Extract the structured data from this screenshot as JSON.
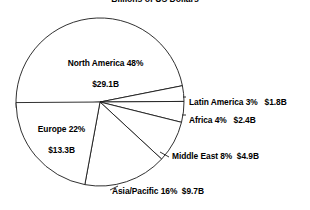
{
  "chart_data": {
    "type": "pie",
    "title": "Billions of US Dollars",
    "subtitle": "",
    "xlabel": "",
    "ylabel": "",
    "grid": false,
    "legend": "none",
    "label_style": "outside-and-inside callouts",
    "units": "Billions of US Dollars",
    "total_value": 61.2,
    "categories": [
      "North America",
      "Latin America",
      "Africa",
      "Middle East",
      "Asia/Pacific",
      "Europe"
    ],
    "values": [
      29.1,
      1.8,
      2.4,
      4.9,
      9.7,
      13.3
    ],
    "percents": [
      48,
      3,
      4,
      8,
      16,
      22
    ],
    "slices": [
      {
        "name": "North America",
        "percent": 48,
        "percent_text": "48%",
        "value": 29.1,
        "value_text": "$29.1B",
        "label_line1": "North America 48%",
        "label_line2": "$29.1B",
        "label_position": "inside",
        "start_angle": 176,
        "end_angle": 348.8
      },
      {
        "name": "Latin America",
        "percent": 3,
        "percent_text": "3%",
        "value": 1.8,
        "value_text": "$1.8B",
        "label_line1": "Latin America 3%   $1.8B",
        "label_line2": "",
        "label_position": "outside-right",
        "start_angle": 348.8,
        "end_angle": 359.6
      },
      {
        "name": "Africa",
        "percent": 4,
        "percent_text": "4%",
        "value": 2.4,
        "value_text": "$2.4B",
        "label_line1": "Africa 4%   $2.4B",
        "label_line2": "",
        "label_position": "outside-right",
        "start_angle": 359.6,
        "end_angle": 14.0
      },
      {
        "name": "Middle East",
        "percent": 8,
        "percent_text": "8%",
        "value": 4.9,
        "value_text": "$4.9B",
        "label_line1": "Middle East 8%  $4.9B",
        "label_line2": "",
        "label_position": "outside-right",
        "start_angle": 14.0,
        "end_angle": 42.8
      },
      {
        "name": "Asia/Pacific",
        "percent": 16,
        "percent_text": "16%",
        "value": 9.7,
        "value_text": "$9.7B",
        "label_line1": "Asia/Pacific 16%  $9.7B",
        "label_line2": "",
        "label_position": "outside-bottom",
        "start_angle": 42.8,
        "end_angle": 100.4
      },
      {
        "name": "Europe",
        "percent": 22,
        "percent_text": "22%",
        "value": 13.3,
        "value_text": "$13.3B",
        "label_line1": "Europe 22%",
        "label_line2": "$13.3B",
        "label_position": "inside-left",
        "start_angle": 100.4,
        "end_angle": 179.6
      }
    ],
    "colors": {
      "slice_fill": "#ffffff",
      "slice_stroke": "#1a1a1a",
      "text": "#000000",
      "background": "#ffffff"
    }
  },
  "geometry": {
    "center_x": 100,
    "center_y": 102,
    "radius": 84
  }
}
